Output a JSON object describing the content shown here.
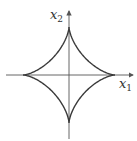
{
  "diagram": {
    "type": "astroid",
    "curve": "|x1|^(2/3) + |x2|^(2/3) = 1",
    "axes": {
      "x": {
        "label_var": "x",
        "label_sub": "1"
      },
      "y": {
        "label_var": "x",
        "label_sub": "2"
      }
    },
    "colors": {
      "curve": "#3a3a3a",
      "axis": "#555555"
    }
  }
}
